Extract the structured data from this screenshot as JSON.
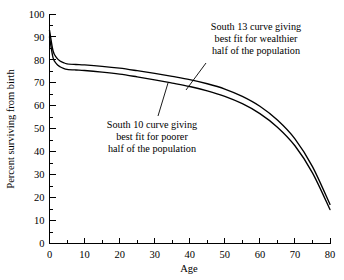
{
  "chart_data": {
    "type": "line",
    "title": "",
    "xlabel": "Age",
    "ylabel": "Percent surviving from birth",
    "xlim": [
      0,
      80
    ],
    "ylim": [
      0,
      100
    ],
    "xticks": [
      0,
      10,
      20,
      30,
      40,
      50,
      60,
      70,
      80
    ],
    "xtick_labels": [
      "0",
      "10",
      "20",
      "30",
      "40",
      "50",
      "60",
      "70",
      "80"
    ],
    "xminor_step": 5,
    "yticks": [
      0,
      10,
      20,
      30,
      40,
      50,
      60,
      70,
      80,
      90,
      100
    ],
    "ytick_labels": [
      "0",
      "10",
      "20",
      "30",
      "40",
      "50",
      "60",
      "70",
      "80",
      "90",
      "100"
    ],
    "yminor_step": 5,
    "grid": false,
    "legend_position": "none",
    "series": [
      {
        "name": "South 13",
        "description": "South 13 curve giving best fit for wealthier half of the population",
        "x": [
          0,
          1,
          2,
          3,
          4,
          5,
          7.5,
          10,
          15,
          20,
          25,
          30,
          35,
          40,
          45,
          50,
          55,
          60,
          65,
          70,
          75,
          80
        ],
        "values": [
          93,
          84,
          81,
          79.5,
          78.8,
          78.3,
          78.0,
          77.8,
          77.2,
          76.4,
          75.3,
          74.1,
          72.8,
          71.4,
          69.6,
          67.3,
          64.1,
          59.8,
          53.8,
          45.6,
          33.5,
          17.0
        ]
      },
      {
        "name": "South 10",
        "description": "South 10 curve giving best fit for poorer half of the population",
        "x": [
          0,
          1,
          2,
          3,
          4,
          5,
          7.5,
          10,
          15,
          20,
          25,
          30,
          35,
          40,
          45,
          50,
          55,
          60,
          65,
          70,
          75,
          80
        ],
        "values": [
          90,
          81,
          78.3,
          77.0,
          76.3,
          75.9,
          75.6,
          75.4,
          74.7,
          73.8,
          72.6,
          71.3,
          69.9,
          68.4,
          66.5,
          64.1,
          60.9,
          56.6,
          50.7,
          42.6,
          30.8,
          14.8
        ]
      }
    ],
    "annotations": [
      {
        "id": "south-13",
        "lines": [
          "South 13 curve giving",
          "best fit for wealthier",
          "half of the population"
        ]
      },
      {
        "id": "south-10",
        "lines": [
          "South 10 curve giving",
          "best fit for poorer",
          "half of the population"
        ]
      }
    ]
  },
  "colors": {
    "ink": "#000000",
    "background": "#ffffff"
  }
}
